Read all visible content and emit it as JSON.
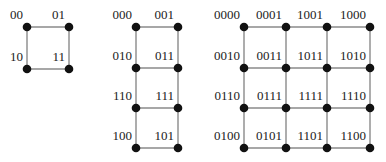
{
  "diagram": {
    "type": "gray-code-grid-graphs",
    "colors": {
      "edge": "#8a8a8a",
      "node": "#111111",
      "label": "#222222"
    },
    "grids": [
      {
        "name": "2-bit",
        "cols": [
          27,
          69
        ],
        "rows": [
          27,
          69
        ],
        "labels": [
          [
            "00",
            "01"
          ],
          [
            "10",
            "11"
          ]
        ]
      },
      {
        "name": "3-bit",
        "cols": [
          136,
          178
        ],
        "rows": [
          27,
          68,
          108,
          148
        ],
        "labels": [
          [
            "000",
            "001"
          ],
          [
            "010",
            "011"
          ],
          [
            "110",
            "111"
          ],
          [
            "100",
            "101"
          ]
        ]
      },
      {
        "name": "4-bit",
        "cols": [
          244,
          286,
          327,
          370
        ],
        "rows": [
          27,
          68,
          108,
          148
        ],
        "labels": [
          [
            "0000",
            "0001",
            "1001",
            "1000"
          ],
          [
            "0010",
            "0011",
            "1011",
            "1010"
          ],
          [
            "0110",
            "0111",
            "1111",
            "1110"
          ],
          [
            "0100",
            "0101",
            "1101",
            "1100"
          ]
        ]
      }
    ]
  }
}
